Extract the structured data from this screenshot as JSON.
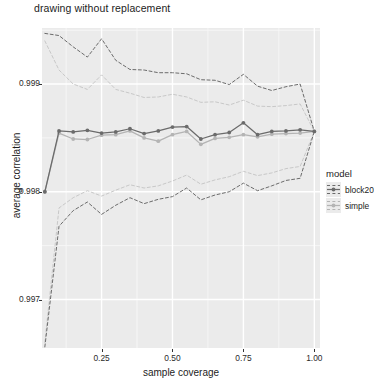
{
  "chart_data": {
    "type": "line",
    "title": "drawing without replacement",
    "xlabel": "sample coverage",
    "ylabel": "average correlation",
    "xlim": [
      0.04,
      1.02
    ],
    "ylim": [
      0.99655,
      0.99952
    ],
    "xticks": [
      0.25,
      0.5,
      0.75,
      1.0
    ],
    "xticklabels": [
      "0.25",
      "0.50",
      "0.75",
      "1.00"
    ],
    "yticks": [
      0.997,
      0.998,
      0.999
    ],
    "yticklabels": [
      "0.997",
      "0.998",
      "0.999"
    ],
    "grid": true,
    "grid_color": "#ffffff",
    "panel_background": "#ebebeb",
    "legend": {
      "title": "model",
      "position": "right",
      "entries": [
        {
          "label": "block20",
          "color": "#6b6b6b",
          "marker": "circle",
          "linestyle": "solid"
        },
        {
          "label": "simple",
          "color": "#b4b4b4",
          "marker": "circle",
          "linestyle": "solid"
        }
      ]
    },
    "x": [
      0.05,
      0.1,
      0.15,
      0.2,
      0.25,
      0.3,
      0.35,
      0.4,
      0.45,
      0.5,
      0.55,
      0.6,
      0.65,
      0.7,
      0.75,
      0.8,
      0.85,
      0.9,
      0.95,
      1.0
    ],
    "series": [
      {
        "name": "block20",
        "color": "#6b6b6b",
        "linestyle": "solid",
        "marker": "circle",
        "values": [
          0.998,
          0.998565,
          0.998555,
          0.99857,
          0.998545,
          0.998555,
          0.998585,
          0.99854,
          0.998565,
          0.9986,
          0.998605,
          0.99849,
          0.99853,
          0.99855,
          0.99864,
          0.99853,
          0.99856,
          0.998565,
          0.998575,
          0.99856
        ]
      },
      {
        "name": "block20-upper",
        "color": "#6b6b6b",
        "linestyle": "dashed",
        "marker": "none",
        "values": [
          0.99947,
          0.99945,
          0.999345,
          0.99925,
          0.99942,
          0.99922,
          0.999135,
          0.99913,
          0.999105,
          0.999105,
          0.999095,
          0.99904,
          0.999035,
          0.998995,
          0.99909,
          0.99898,
          0.99894,
          0.998975,
          0.999,
          0.99856
        ]
      },
      {
        "name": "block20-lower",
        "color": "#6b6b6b",
        "linestyle": "dashed",
        "marker": "none",
        "values": [
          0.99656,
          0.99768,
          0.997825,
          0.997905,
          0.99779,
          0.997875,
          0.997945,
          0.99789,
          0.99793,
          0.997955,
          0.998035,
          0.997925,
          0.99797,
          0.998,
          0.99808,
          0.99801,
          0.998055,
          0.998105,
          0.998125,
          0.99856
        ]
      },
      {
        "name": "simple",
        "color": "#b4b4b4",
        "linestyle": "solid",
        "marker": "circle",
        "values": [
          0.998,
          0.998545,
          0.99849,
          0.998485,
          0.998525,
          0.99853,
          0.998565,
          0.9985,
          0.99847,
          0.99853,
          0.99856,
          0.99844,
          0.998495,
          0.998505,
          0.99853,
          0.99851,
          0.998535,
          0.99854,
          0.998545,
          0.99856
        ]
      },
      {
        "name": "simple-upper",
        "color": "#c8c8c8",
        "linestyle": "dashed",
        "marker": "none",
        "values": [
          0.9994,
          0.99913,
          0.999,
          0.99895,
          0.999085,
          0.99895,
          0.998915,
          0.998875,
          0.99888,
          0.998905,
          0.99888,
          0.99883,
          0.998835,
          0.998805,
          0.99885,
          0.998795,
          0.99879,
          0.9988,
          0.998815,
          0.99856
        ]
      },
      {
        "name": "simple-lower",
        "color": "#c8c8c8",
        "linestyle": "dashed",
        "marker": "none",
        "values": [
          0.9966,
          0.99785,
          0.997945,
          0.99801,
          0.99796,
          0.998015,
          0.998065,
          0.998035,
          0.998055,
          0.9981,
          0.998155,
          0.99807,
          0.99811,
          0.99814,
          0.99819,
          0.99815,
          0.998175,
          0.998215,
          0.998235,
          0.99856
        ]
      }
    ]
  }
}
